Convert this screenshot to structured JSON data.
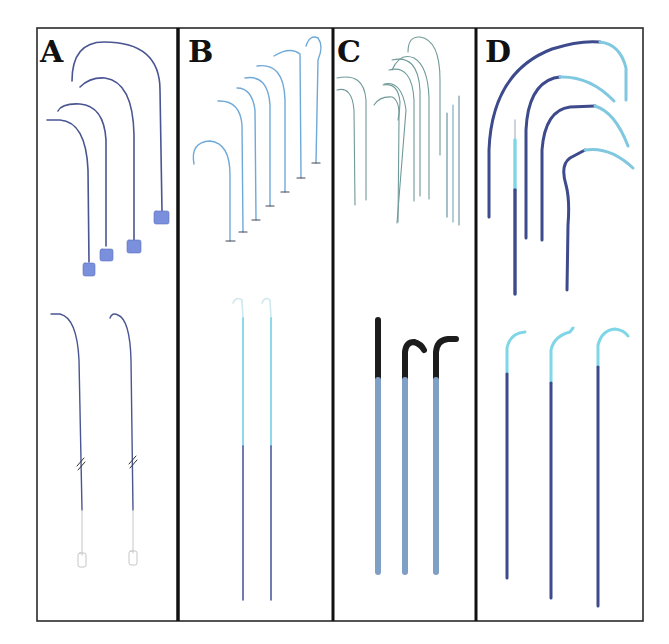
{
  "figure": {
    "frame": {
      "left": 37,
      "top": 28,
      "right": 643,
      "bottom": 621,
      "border_color": "#2a2a2a"
    },
    "dividers": [
      178,
      333,
      476
    ],
    "colors": {
      "navy": "#3d4a8c",
      "navy_dark": "#2f3a78",
      "light_blue": "#6fc8e0",
      "cyan": "#7fd6e6",
      "steel": "#7f9fc4",
      "black_tip": "#1c1c1c",
      "hub_blue": "#6f86d6",
      "gray_green": "#6f9a98"
    },
    "panels": [
      {
        "id": "A",
        "label": "A",
        "description": "Curved catheters with hub connectors (top) and two straight guidewires with break marks and luer connectors (bottom)"
      },
      {
        "id": "B",
        "label": "B",
        "description": "Seven curved light-blue wires with T-ends (top) and two long straight wires, cyan upper / navy lower (bottom)"
      },
      {
        "id": "C",
        "label": "C",
        "description": "Multiple thin curved gray-green wires (top) and three thick steel-blue rods with black curved tips (bottom)"
      },
      {
        "id": "D",
        "label": "D",
        "description": "Four thick curved navy catheters with cyan tips and one straight dual-tone catheter (top), three straight navy catheters with cyan hooked tips (bottom)"
      }
    ]
  }
}
